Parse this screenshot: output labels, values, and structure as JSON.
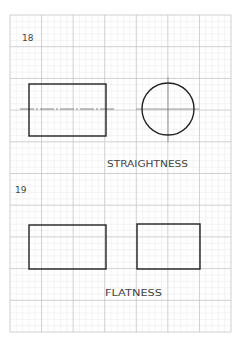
{
  "page": {
    "background": "#ffffff",
    "grid": {
      "left": 10,
      "top": 15,
      "right": 231,
      "bottom": 332,
      "major_cols": 7,
      "major_rows": 10,
      "minor_per_major": 5,
      "major_color": "#c4c4c4",
      "minor_color": "#ececec"
    },
    "ink_color": "#222222"
  },
  "exercises": [
    {
      "number": "18",
      "caption": "STRAIGHTNESS",
      "shapes": {
        "rectangle": {
          "x": 29,
          "y": 84,
          "w": 77,
          "h": 52
        },
        "rect_centerline": {
          "x1": 20,
          "x2": 114,
          "y": 109
        },
        "circle": {
          "cx": 168,
          "cy": 109,
          "r": 26
        },
        "circle_h_line": {
          "x1": 136,
          "x2": 199,
          "y": 109
        },
        "circle_v_line": {
          "x": 168,
          "y1": 77,
          "y2": 142
        }
      }
    },
    {
      "number": "19",
      "caption": "FLATNESS",
      "shapes": {
        "rectangle_left": {
          "x": 29,
          "y": 225,
          "w": 77,
          "h": 44
        },
        "rectangle_right": {
          "x": 137,
          "y": 224,
          "w": 63,
          "h": 45
        }
      }
    }
  ]
}
